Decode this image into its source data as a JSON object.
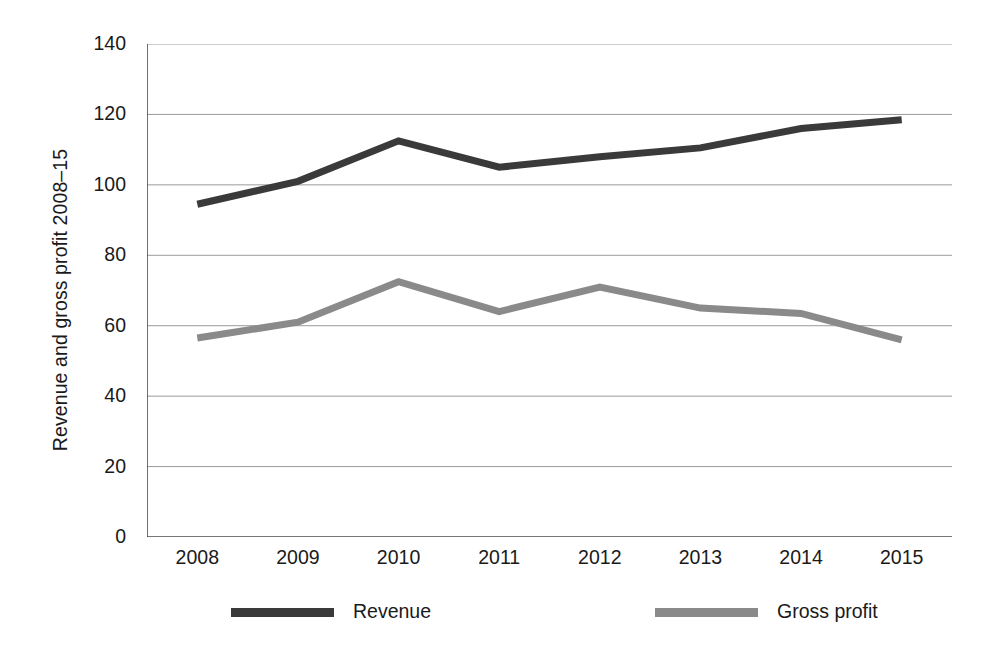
{
  "chart_data": {
    "type": "line",
    "title": "",
    "xlabel": "",
    "ylabel": "Revenue and gross profit 2008–15",
    "categories": [
      "2008",
      "2009",
      "2010",
      "2011",
      "2012",
      "2013",
      "2014",
      "2015"
    ],
    "ylim": [
      0,
      140
    ],
    "yticks": [
      0,
      20,
      40,
      60,
      80,
      100,
      120,
      140
    ],
    "ytick_labels": [
      "0",
      "20",
      "40",
      "60",
      "80",
      "100",
      "120",
      "140"
    ],
    "grid": true,
    "grid_axis": "y",
    "legend_position": "bottom",
    "series": [
      {
        "name": "Revenue",
        "color": "#3a3a3a",
        "values": [
          94.5,
          101,
          112.5,
          105,
          108,
          110.5,
          116,
          118.5
        ]
      },
      {
        "name": "Gross profit",
        "color": "#8a8a8a",
        "values": [
          56.5,
          61,
          72.5,
          64,
          71,
          65,
          63.5,
          56
        ]
      }
    ]
  },
  "axis": {
    "y_title": "Revenue and gross profit 2008–15"
  },
  "colors": {
    "revenue": "#3a3a3a",
    "gross_profit": "#8a8a8a",
    "grid": "#9a9a9a",
    "axis": "#4a4a4a",
    "background": "#ffffff"
  }
}
